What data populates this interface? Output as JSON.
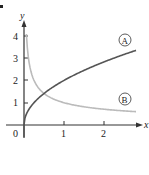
{
  "chart_data": {
    "type": "line",
    "title": "",
    "xlabel": "x",
    "ylabel": "y",
    "origin_label": "0",
    "xlim": [
      0,
      2.8
    ],
    "ylim": [
      0,
      4.4
    ],
    "x_ticks": [
      1,
      2
    ],
    "x_tick_labels": [
      "1",
      "2"
    ],
    "y_ticks": [
      1,
      2,
      3,
      4
    ],
    "y_tick_labels": [
      "1",
      "2",
      "3",
      "4"
    ],
    "grid": false,
    "legend": "inline circled labels at right end of curves",
    "series": [
      {
        "name": "A",
        "label": "A",
        "color": "#555555",
        "formula_estimate": "y = 2*sqrt(x)",
        "x": [
          0,
          0.05,
          0.1,
          0.25,
          0.5,
          1,
          1.5,
          2,
          2.5,
          2.8
        ],
        "y": [
          0,
          0.45,
          0.63,
          1.0,
          1.41,
          2.0,
          2.45,
          2.83,
          3.16,
          3.35
        ]
      },
      {
        "name": "B",
        "label": "B",
        "color": "#bbbbbb",
        "formula_estimate": "y = 1/sqrt(x)",
        "x": [
          0.06,
          0.1,
          0.25,
          0.5,
          1,
          1.5,
          2,
          2.5,
          2.8
        ],
        "y": [
          4.08,
          3.16,
          2.0,
          1.41,
          1.0,
          0.82,
          0.71,
          0.63,
          0.6
        ]
      }
    ],
    "annotations": [
      {
        "text": "A",
        "style": "circled",
        "near": "end of curve A"
      },
      {
        "text": "B",
        "style": "circled",
        "near": "end of curve B"
      }
    ]
  }
}
